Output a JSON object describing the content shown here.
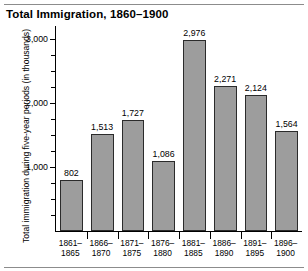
{
  "chart_data": {
    "type": "bar",
    "title": "Total Immigration, 1860–1900",
    "xlabel": "",
    "ylabel": "Total immigration during five-year periods (in thousands)",
    "categories": [
      "1861–\n1865",
      "1866–\n1870",
      "1871–\n1875",
      "1876–\n1880",
      "1881–\n1885",
      "1886–\n1890",
      "1891–\n1895",
      "1896–\n1900"
    ],
    "category_lines": [
      [
        "1861–",
        "1865"
      ],
      [
        "1866–",
        "1870"
      ],
      [
        "1871–",
        "1875"
      ],
      [
        "1876–",
        "1880"
      ],
      [
        "1881–",
        "1885"
      ],
      [
        "1886–",
        "1890"
      ],
      [
        "1891–",
        "1895"
      ],
      [
        "1896–",
        "1900"
      ]
    ],
    "values": [
      802,
      1513,
      1727,
      1086,
      2976,
      2271,
      2124,
      1564
    ],
    "value_labels": [
      "802",
      "1,513",
      "1,727",
      "1,086",
      "2,976",
      "2,271",
      "2,124",
      "1,564"
    ],
    "ylim": [
      0,
      3200
    ],
    "yticks": [
      1000,
      2000,
      3000
    ],
    "ytick_labels": [
      "1,000",
      "2,000",
      "3,000"
    ],
    "yminor_ticks": [
      250,
      500,
      750,
      1250,
      1500,
      1750,
      2250,
      2500,
      2750
    ],
    "grid": false,
    "legend": null,
    "bar_color": "#9d9d9d",
    "bar_edge_color": "#2b2b2b",
    "axis_color": "#000000",
    "background_color": "#ffffff"
  }
}
